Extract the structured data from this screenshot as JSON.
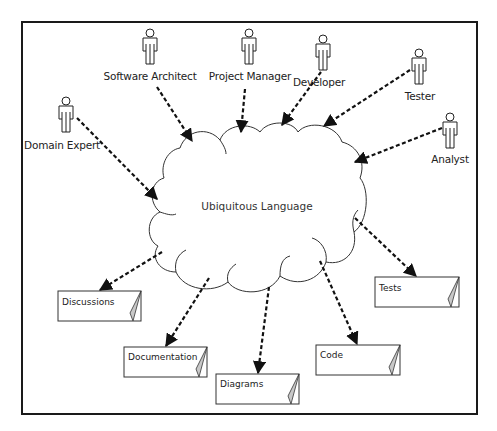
{
  "diagram": {
    "title_fragment": "",
    "center": {
      "label": "Ubiquitous Language",
      "shape": "cloud"
    },
    "actors": [
      {
        "id": "software-architect",
        "label": "Software Architect"
      },
      {
        "id": "project-manager",
        "label": "Project Manager"
      },
      {
        "id": "developer",
        "label": "Developer"
      },
      {
        "id": "tester",
        "label": "Tester"
      },
      {
        "id": "analyst",
        "label": "Analyst"
      },
      {
        "id": "domain-expert",
        "label": "Domain Expert"
      }
    ],
    "artifacts": [
      {
        "id": "discussions",
        "label": "Discussions"
      },
      {
        "id": "documentation",
        "label": "Documentation"
      },
      {
        "id": "diagrams",
        "label": "Diagrams"
      },
      {
        "id": "code",
        "label": "Code"
      },
      {
        "id": "tests",
        "label": "Tests"
      }
    ],
    "edges": [
      {
        "from": "Software Architect",
        "to": "Ubiquitous Language",
        "style": "dashed-arrow"
      },
      {
        "from": "Project Manager",
        "to": "Ubiquitous Language",
        "style": "dashed-arrow"
      },
      {
        "from": "Developer",
        "to": "Ubiquitous Language",
        "style": "dashed-arrow"
      },
      {
        "from": "Tester",
        "to": "Ubiquitous Language",
        "style": "dashed-arrow"
      },
      {
        "from": "Analyst",
        "to": "Ubiquitous Language",
        "style": "dashed-arrow"
      },
      {
        "from": "Domain Expert",
        "to": "Ubiquitous Language",
        "style": "dashed-arrow"
      },
      {
        "from": "Ubiquitous Language",
        "to": "Discussions",
        "style": "dashed-arrow"
      },
      {
        "from": "Ubiquitous Language",
        "to": "Documentation",
        "style": "dashed-arrow"
      },
      {
        "from": "Ubiquitous Language",
        "to": "Diagrams",
        "style": "dashed-arrow"
      },
      {
        "from": "Ubiquitous Language",
        "to": "Code",
        "style": "dashed-arrow"
      },
      {
        "from": "Ubiquitous Language",
        "to": "Tests",
        "style": "dashed-arrow"
      }
    ],
    "colors": {
      "line": "#1a1a1a",
      "fold": "#c8c8c8",
      "background": "#ffffff"
    }
  }
}
